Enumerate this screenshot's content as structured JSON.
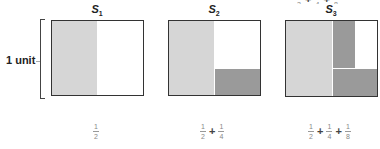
{
  "figure": {
    "unit_label": "1 unit",
    "top_cut_text": {
      "parts": [
        "1/2",
        "+",
        "1/4",
        "+",
        "1/8"
      ]
    },
    "colors": {
      "light_shade": "#d6d6d6",
      "dark_shade": "#9a9a9a",
      "border": "#333333"
    },
    "panels": [
      {
        "label": "S",
        "subscript": "1",
        "regions": [
          "left half light"
        ],
        "sum": [
          {
            "num": "1",
            "den": "2"
          }
        ],
        "plus": []
      },
      {
        "label": "S",
        "subscript": "2",
        "regions": [
          "left half light",
          "bottom-right quarter dark"
        ],
        "sum": [
          {
            "num": "1",
            "den": "2"
          },
          {
            "num": "1",
            "den": "4"
          }
        ],
        "plus": [
          "+"
        ]
      },
      {
        "label": "S",
        "subscript": "3",
        "regions": [
          "left half light",
          "bottom-right quarter dark",
          "top-right eighth dark"
        ],
        "sum": [
          {
            "num": "1",
            "den": "2"
          },
          {
            "num": "1",
            "den": "4"
          },
          {
            "num": "1",
            "den": "8"
          }
        ],
        "plus": [
          "+",
          "+"
        ]
      }
    ]
  }
}
